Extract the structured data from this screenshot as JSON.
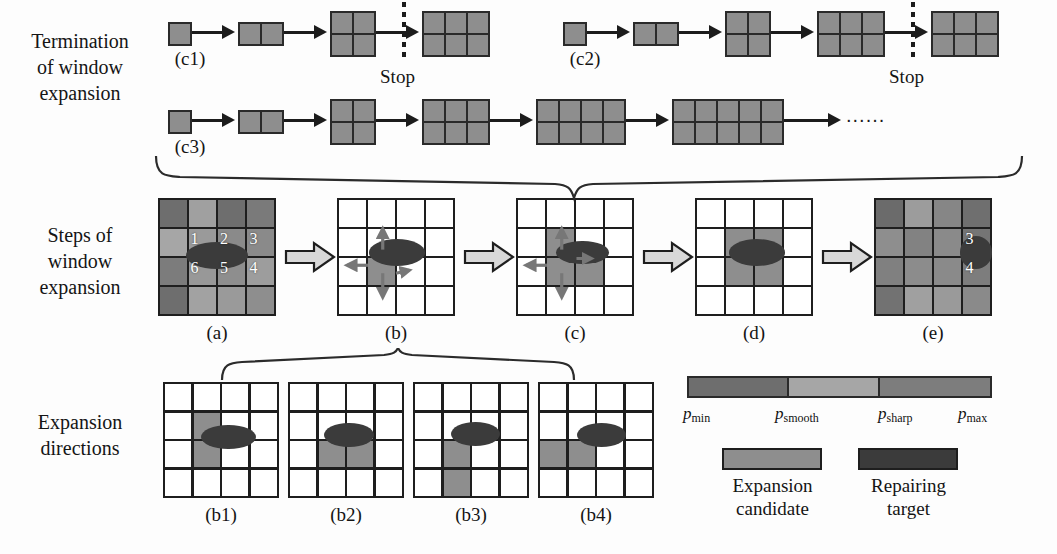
{
  "figure": {
    "width": 1057,
    "height": 554,
    "background": "#fdfdfd"
  },
  "colors": {
    "p_min": "#6e6e6e",
    "p_smooth": "#a6a6a6",
    "p_max": "#7d7d7d",
    "expansion_candidate": "#8e8e8e",
    "repairing_target": "#3b3b3b",
    "grid_line": "#1e1e1e",
    "arrow": "#1c1c1c",
    "cell_empty": "#ffffff",
    "seq_cell": "#8e8e8e"
  },
  "rows": [
    {
      "id": "termination",
      "label": "Termination\nof window\nexpansion"
    },
    {
      "id": "steps",
      "label": "Steps of\nwindow\nexpansion"
    },
    {
      "id": "directions",
      "label": "Expansion\ndirections"
    }
  ],
  "termination": {
    "sequences": [
      {
        "id": "c1",
        "caption": "(c1)",
        "stop_label": "Stop",
        "stop_after_index": 2,
        "blocks": [
          {
            "cols": 1,
            "rows": 1
          },
          {
            "cols": 2,
            "rows": 1
          },
          {
            "cols": 2,
            "rows": 2
          },
          {
            "cols": 3,
            "rows": 2
          }
        ]
      },
      {
        "id": "c2",
        "caption": "(c2)",
        "stop_label": "Stop",
        "stop_after_index": 3,
        "blocks": [
          {
            "cols": 1,
            "rows": 1
          },
          {
            "cols": 2,
            "rows": 1
          },
          {
            "cols": 2,
            "rows": 2
          },
          {
            "cols": 3,
            "rows": 2
          },
          {
            "cols": 3,
            "rows": 2
          }
        ]
      },
      {
        "id": "c3",
        "caption": "(c3)",
        "stop_label": "",
        "trailing_dots": "......",
        "blocks": [
          {
            "cols": 1,
            "rows": 1
          },
          {
            "cols": 2,
            "rows": 1
          },
          {
            "cols": 2,
            "rows": 2
          },
          {
            "cols": 3,
            "rows": 2
          },
          {
            "cols": 4,
            "rows": 2
          },
          {
            "cols": 5,
            "rows": 2
          }
        ]
      }
    ]
  },
  "steps": {
    "panels": [
      {
        "id": "a",
        "caption": "(a)",
        "filled": true,
        "cell_numbers": [
          {
            "text": "1",
            "col": 1,
            "row": 1
          },
          {
            "text": "2",
            "col": 2,
            "row": 1
          },
          {
            "text": "3",
            "col": 3,
            "row": 1
          },
          {
            "text": "4",
            "col": 3,
            "row": 2
          },
          {
            "text": "5",
            "col": 2,
            "row": 2
          },
          {
            "text": "6",
            "col": 1,
            "row": 2
          }
        ],
        "shades": [
          [
            "#6e6e6e",
            "#a0a0a0",
            "#6e6e6e",
            "#7a7a7a"
          ],
          [
            "#a6a6a6",
            "#9a9a9a",
            "#8a8a8a",
            "#8a8a8a"
          ],
          [
            "#7c7c7c",
            "#989898",
            "#8e8e8e",
            "#9d9d9d"
          ],
          [
            "#6e6e6e",
            "#a2a2a2",
            "#9a9a9a",
            "#8e8e8e"
          ]
        ],
        "ellipse": {
          "cx": 2.0,
          "cy": 1.95,
          "rx": 1.05,
          "ry": 0.45
        }
      },
      {
        "id": "b",
        "caption": "(b)",
        "filled": false,
        "gray_cells": [
          {
            "col": 1,
            "row": 2
          }
        ],
        "ellipse": {
          "cx": 2.05,
          "cy": 1.85,
          "rx": 0.95,
          "ry": 0.45
        },
        "dir_arrows": [
          "up",
          "left",
          "down",
          "right-short"
        ]
      },
      {
        "id": "c",
        "caption": "(c)",
        "filled": false,
        "gray_cells": [
          {
            "col": 1,
            "row": 1
          },
          {
            "col": 1,
            "row": 2
          },
          {
            "col": 2,
            "row": 2
          }
        ],
        "ellipse": {
          "cx": 2.25,
          "cy": 1.85,
          "rx": 0.9,
          "ry": 0.4
        },
        "dir_arrows": [
          "up",
          "left",
          "down",
          "right-inside"
        ]
      },
      {
        "id": "d",
        "caption": "(d)",
        "filled": false,
        "gray_cells": [
          {
            "col": 1,
            "row": 1
          },
          {
            "col": 1,
            "row": 2
          },
          {
            "col": 2,
            "row": 1
          },
          {
            "col": 2,
            "row": 2
          }
        ],
        "ellipse": {
          "cx": 2.1,
          "cy": 1.85,
          "rx": 0.95,
          "ry": 0.45
        },
        "dir_arrows": []
      },
      {
        "id": "e",
        "caption": "(e)",
        "filled": true,
        "cell_numbers": [
          {
            "text": "3",
            "col": 3,
            "row": 1
          },
          {
            "text": "4",
            "col": 3,
            "row": 2
          }
        ],
        "shades": [
          [
            "#6b6b6b",
            "#9c9c9c",
            "#868686",
            "#6f6f6f"
          ],
          [
            "#8e8e8e",
            "#828282",
            "#8a8a8a",
            "#757575"
          ],
          [
            "#808080",
            "#8c8c8c",
            "#8a8a8a",
            "#7d7d7d"
          ],
          [
            "#727272",
            "#a0a0a0",
            "#9a9a9a",
            "#8a8a8a"
          ]
        ],
        "ellipse": {
          "cx": 3.45,
          "cy": 1.85,
          "rx": 0.55,
          "ry": 0.55
        }
      }
    ]
  },
  "directions": {
    "panels": [
      {
        "id": "b1",
        "caption": "(b1)",
        "gray_cells": [
          {
            "col": 1,
            "row": 1
          },
          {
            "col": 1,
            "row": 2
          }
        ],
        "ellipse": {
          "cx": 2.25,
          "cy": 1.9,
          "rx": 0.95,
          "ry": 0.42
        }
      },
      {
        "id": "b2",
        "caption": "(b2)",
        "gray_cells": [
          {
            "col": 1,
            "row": 2
          },
          {
            "col": 2,
            "row": 2
          }
        ],
        "ellipse": {
          "cx": 2.1,
          "cy": 1.82,
          "rx": 0.85,
          "ry": 0.42
        }
      },
      {
        "id": "b3",
        "caption": "(b3)",
        "gray_cells": [
          {
            "col": 1,
            "row": 2
          },
          {
            "col": 1,
            "row": 3
          }
        ],
        "ellipse": {
          "cx": 2.15,
          "cy": 1.8,
          "rx": 0.85,
          "ry": 0.42
        }
      },
      {
        "id": "b4",
        "caption": "(b4)",
        "gray_cells": [
          {
            "col": 0,
            "row": 2
          },
          {
            "col": 1,
            "row": 2
          }
        ],
        "ellipse": {
          "cx": 2.2,
          "cy": 1.82,
          "rx": 0.85,
          "ry": 0.42
        }
      }
    ]
  },
  "legend": {
    "gradient_segments": [
      {
        "color": "#6e6e6e",
        "flex": 33
      },
      {
        "color": "#a6a6a6",
        "flex": 30
      },
      {
        "color": "#7d7d7d",
        "flex": 37
      }
    ],
    "ticks": [
      {
        "symbol": "p",
        "sub": "min"
      },
      {
        "symbol": "p",
        "sub": "smooth"
      },
      {
        "symbol": "p",
        "sub": "sharp"
      },
      {
        "symbol": "p",
        "sub": "max"
      }
    ],
    "items": [
      {
        "id": "expansion-candidate",
        "color": "#8e8e8e",
        "label": "Expansion\ncandidate"
      },
      {
        "id": "repairing-target",
        "color": "#3b3b3b",
        "label": "Repairing\ntarget"
      }
    ]
  }
}
